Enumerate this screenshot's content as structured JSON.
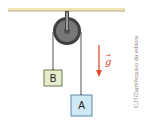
{
  "diagram": {
    "type": "atwood-machine",
    "ceiling": {
      "color": "#e8d9a6",
      "edge_color": "#b8a878"
    },
    "pulley": {
      "outer_color": "#4a4a4a",
      "inner_color": "#7a7a7a"
    },
    "rope_color": "#555555",
    "blocks": [
      {
        "id": "B",
        "label": "B",
        "fill": "#e4eccb",
        "stroke": "#6d7a4f"
      },
      {
        "id": "A",
        "label": "A",
        "fill": "#cfe8f5",
        "stroke": "#5b8aa3"
      }
    ],
    "gravity": {
      "label": "g",
      "vector_arrow": "→",
      "color": "#e04a2a"
    }
  },
  "credit": "CJT/Zapt/Arquivo da editora"
}
